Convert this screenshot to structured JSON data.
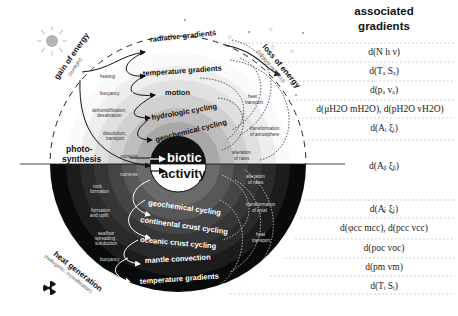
{
  "header": {
    "line1": "associated",
    "line2": "gradients"
  },
  "gradients": [
    "d(N h ν)",
    "d(Tₐ Sₐ)",
    "d(pₐ vₐ)",
    "d(μH2O mH2O), d(pH2O vH2O)",
    "d(Aᵢ ξᵢ)",
    "d(Aᵦ ξᵦ)",
    "d(Aⱼ ξⱼ)",
    "d(φcc mcc), d(pcc vcc)",
    "d(poc voc)",
    "d(pm vm)",
    "d(Tᵢ Sᵢ)"
  ],
  "upper_cycles": [
    "radiative gradients",
    "temperature gradients",
    "motion",
    "hydrologic cycling",
    "geochemical cycling"
  ],
  "lower_cycles": [
    "geochemical cycling",
    "continental crust cycling",
    "oceanic crust cycling",
    "mantle convection",
    "temperature gradients"
  ],
  "center": {
    "top": "biotic",
    "bottom": "activity"
  },
  "energy": {
    "gain_title": "gain of energy",
    "gain_sub": "(sunlight)",
    "loss_title": "loss of energy",
    "loss_sub": "(infrared radiation)",
    "heat_title": "heat generation",
    "heat_sub": "(radiogenic, crystallization)",
    "photosynthesis_1": "photo-",
    "photosynthesis_2": "synthesis"
  },
  "upper_left_labels": {
    "heating": "heating",
    "buoyancy": "buoyancy",
    "dehum_1": "dehumidification,",
    "dehum_2": "desalination",
    "dissol_1": "dissolution,",
    "dissol_2": "transport",
    "nutrients": "nutrients"
  },
  "upper_right_labels": {
    "heat_1": "heat",
    "heat_2": "transport",
    "atm_1": "transformation",
    "atm_2": "of atmosphere",
    "alt_1": "alteration",
    "alt_2": "of rates"
  },
  "lower_left_labels": {
    "nutrients": "nutrients",
    "rock_1": "rock",
    "rock_2": "formation",
    "form_1": "formation",
    "form_2": "and uplift",
    "sea_1": "seafloor",
    "sea_2": "spreading,",
    "sea_3": "subduction",
    "buoyancy": "buoyancy"
  },
  "lower_right_labels": {
    "alt_1": "alteration",
    "alt_2": "of rates",
    "crust_1": "transformation",
    "crust_2": "of crust",
    "heat_1": "heat",
    "heat_2": "transport"
  },
  "icons": {
    "sun": "sun-icon",
    "stars": "star-icon",
    "radiation": "radiation-icon"
  }
}
